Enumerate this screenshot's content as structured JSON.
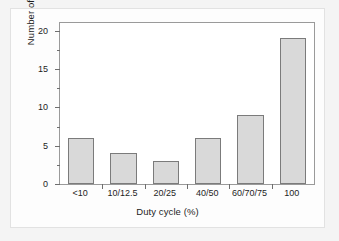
{
  "chart_data": {
    "type": "bar",
    "title": "",
    "subtitle": "",
    "xlabel": "Duty cycle (%)",
    "ylabel": "Number of reports",
    "categories": [
      "<10",
      "10/12.5",
      "20/25",
      "40/50",
      "60/70/75",
      "100"
    ],
    "values": [
      6,
      4,
      3,
      6,
      9,
      19
    ],
    "ylim": [
      0,
      21
    ],
    "yticks": [
      0,
      5,
      10,
      15,
      20
    ],
    "ytick_labels": [
      "0",
      "5",
      "10",
      "15",
      "20"
    ],
    "yminor_ticks": [
      2.5,
      7.5,
      12.5,
      17.5
    ],
    "grid": false,
    "legend": null,
    "annotations": [],
    "colors": {
      "bar_fill": "#d9d9d9",
      "bar_edge": "#7b7b7b",
      "axis": "#6e6e6e",
      "text": "#1d1d1d",
      "plot_background": "#ffffff",
      "card_background": "#fdfdfd",
      "page_background": "#f4f4f4"
    }
  }
}
